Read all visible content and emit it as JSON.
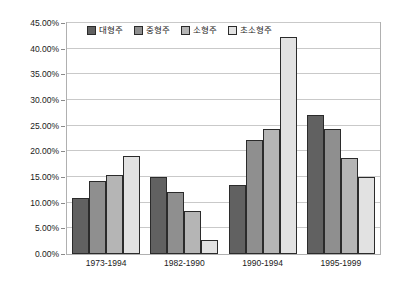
{
  "chart_data": {
    "type": "bar",
    "title": "",
    "xlabel": "",
    "ylabel": "",
    "ylim": [
      0,
      45
    ],
    "ytick_labels": [
      "0.00%",
      "5.00%",
      "10.00%",
      "15.00%",
      "20.00%",
      "25.00%",
      "30.00%",
      "35.00%",
      "40.00%",
      "45.00%"
    ],
    "ytick_values": [
      0,
      5,
      10,
      15,
      20,
      25,
      30,
      35,
      40,
      45
    ],
    "grid": true,
    "legend_position": "top-left-inside",
    "categories": [
      "1973-1994",
      "1982-1990",
      "1990-1994",
      "1995-1999"
    ],
    "series": [
      {
        "name": "대형주",
        "color": "#616161",
        "values": [
          11.0,
          15.1,
          13.4,
          27.1
        ]
      },
      {
        "name": "중형주",
        "color": "#8f8f8f",
        "values": [
          14.2,
          12.0,
          22.2,
          24.4
        ]
      },
      {
        "name": "소형주",
        "color": "#b5b5b5",
        "values": [
          15.3,
          8.3,
          24.4,
          18.7
        ]
      },
      {
        "name": "초소형주",
        "color": "#e2e2e2",
        "values": [
          19.1,
          2.7,
          42.2,
          15.1
        ]
      }
    ]
  }
}
